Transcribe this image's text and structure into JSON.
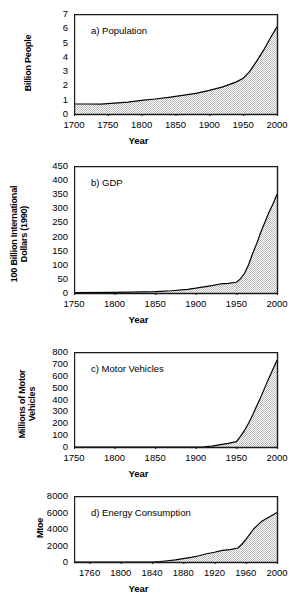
{
  "figure": {
    "panel_count": 4,
    "xlabel": "Year",
    "fill_color": "#d9d9d9",
    "line_color": "#000000",
    "axis_color": "#1a1a1a"
  },
  "chart_data": [
    {
      "type": "area",
      "panel": "a",
      "title": "a)   Population",
      "tag": "a)",
      "name": "Population",
      "xlabel": "Year",
      "ylabel": "Billion People",
      "xlim": [
        1700,
        2000
      ],
      "ylim": [
        0,
        7
      ],
      "xticks": [
        1700,
        1750,
        1800,
        1850,
        1900,
        1950,
        2000
      ],
      "yticks": [
        0,
        1,
        2,
        3,
        4,
        5,
        6,
        7
      ],
      "grid": false,
      "legend": "none",
      "x": [
        1700,
        1720,
        1740,
        1750,
        1760,
        1780,
        1800,
        1820,
        1840,
        1850,
        1860,
        1880,
        1900,
        1920,
        1930,
        1940,
        1950,
        1960,
        1970,
        1980,
        1990,
        2000
      ],
      "values": [
        0.7,
        0.7,
        0.69,
        0.72,
        0.76,
        0.83,
        0.95,
        1.05,
        1.17,
        1.24,
        1.3,
        1.45,
        1.65,
        1.9,
        2.07,
        2.25,
        2.5,
        3.0,
        3.7,
        4.45,
        5.3,
        6.1
      ]
    },
    {
      "type": "area",
      "panel": "b",
      "title": "b)   GDP",
      "tag": "b)",
      "name": "GDP",
      "xlabel": "Year",
      "ylabel": "100 Billion International\nDollars (1990)",
      "xlim": [
        1750,
        2000
      ],
      "ylim": [
        0,
        450
      ],
      "xticks": [
        1750,
        1800,
        1850,
        1900,
        1950,
        2000
      ],
      "yticks": [
        0,
        50,
        100,
        150,
        200,
        250,
        300,
        350,
        400,
        450
      ],
      "grid": false,
      "legend": "none",
      "x": [
        1750,
        1800,
        1820,
        1850,
        1870,
        1890,
        1900,
        1910,
        1920,
        1930,
        1940,
        1950,
        1955,
        1960,
        1965,
        1970,
        1975,
        1980,
        1985,
        1990,
        1995,
        2000
      ],
      "values": [
        1,
        2,
        3,
        5,
        8,
        13,
        17,
        22,
        26,
        32,
        34,
        38,
        50,
        70,
        100,
        140,
        175,
        215,
        250,
        285,
        315,
        350
      ]
    },
    {
      "type": "area",
      "panel": "c",
      "title": "c)   Motor Vehicles",
      "tag": "c)",
      "name": "Motor Vehicles",
      "xlabel": "Year",
      "ylabel": "Millions of Motor\nVehicles",
      "xlim": [
        1750,
        2000
      ],
      "ylim": [
        0,
        800
      ],
      "xticks": [
        1750,
        1800,
        1850,
        1900,
        1950,
        2000
      ],
      "yticks": [
        0,
        100,
        200,
        300,
        400,
        500,
        600,
        700,
        800
      ],
      "grid": false,
      "legend": "none",
      "x": [
        1750,
        1850,
        1900,
        1910,
        1920,
        1930,
        1940,
        1950,
        1955,
        1960,
        1965,
        1970,
        1975,
        1980,
        1985,
        1990,
        1995,
        2000
      ],
      "values": [
        0,
        0,
        0,
        2,
        8,
        20,
        30,
        45,
        90,
        140,
        200,
        270,
        345,
        420,
        500,
        580,
        655,
        730
      ]
    },
    {
      "type": "area",
      "panel": "d",
      "title": "d)   Energy Consumption",
      "tag": "d)",
      "name": "Energy Consumption",
      "xlabel": "Year",
      "ylabel": "Mtoe",
      "xlim": [
        1740,
        2000
      ],
      "ylim": [
        0,
        8000
      ],
      "xticks": [
        1760,
        1800,
        1840,
        1880,
        1920,
        1960,
        2000
      ],
      "yticks": [
        0,
        2000,
        4000,
        6000,
        8000
      ],
      "grid": false,
      "legend": "none",
      "x": [
        1740,
        1800,
        1840,
        1850,
        1860,
        1870,
        1880,
        1890,
        1900,
        1910,
        1920,
        1930,
        1940,
        1950,
        1955,
        1960,
        1970,
        1980,
        1990,
        2000
      ],
      "values": [
        0,
        0,
        0,
        60,
        150,
        260,
        400,
        560,
        760,
        1000,
        1180,
        1400,
        1500,
        1700,
        2150,
        2700,
        4000,
        4900,
        5450,
        6000
      ]
    }
  ]
}
